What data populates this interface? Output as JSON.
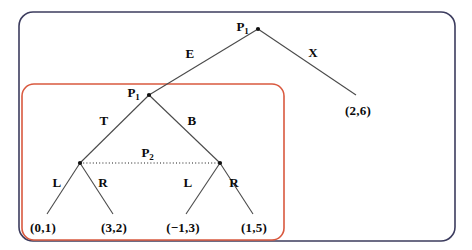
{
  "diagram": {
    "type": "game-tree",
    "background": "#ffffff",
    "boxes": [
      {
        "id": "outer-box",
        "name": "outer-scope-box",
        "color": "#3c3c5e",
        "x": 19,
        "y": 12,
        "width": 436,
        "height": 229,
        "radius": 14
      },
      {
        "id": "inner-box",
        "name": "inner-scope-box",
        "color": "#d9593f",
        "x": 22,
        "y": 84,
        "width": 262,
        "height": 156,
        "radius": 12
      }
    ],
    "nodes": [
      {
        "id": "root",
        "name": "root-node-p1",
        "label": "P",
        "sub": "1",
        "x": 258,
        "y": 29,
        "label_x": 243,
        "label_y": 26,
        "dot": true
      },
      {
        "id": "inner",
        "name": "inner-node-p1",
        "label": "P",
        "sub": "1",
        "x": 149,
        "y": 95,
        "label_x": 134,
        "label_y": 92,
        "dot": true
      },
      {
        "id": "left",
        "name": "left-internal-node",
        "label": "",
        "sub": "",
        "x": 80,
        "y": 163,
        "label_x": 80,
        "label_y": 163,
        "dot": true
      },
      {
        "id": "right",
        "name": "right-internal-node",
        "label": "",
        "sub": "",
        "x": 220,
        "y": 163,
        "label_x": 220,
        "label_y": 163,
        "dot": true
      }
    ],
    "infoset": {
      "name": "information-set-p2",
      "label": "P",
      "sub": "2",
      "from_x": 80,
      "from_y": 163,
      "to_x": 220,
      "to_y": 163,
      "label_x": 148,
      "label_y": 152,
      "style": "dotted"
    },
    "edges": [
      {
        "name": "edge-root-to-inner",
        "x1": 258,
        "y1": 29,
        "x2": 149,
        "y2": 95,
        "label": "E",
        "label_x": 190,
        "label_y": 53
      },
      {
        "name": "edge-root-to-leaf-x",
        "x1": 258,
        "y1": 29,
        "x2": 356,
        "y2": 95,
        "label": "X",
        "label_x": 313,
        "label_y": 52
      },
      {
        "name": "edge-inner-to-left",
        "x1": 149,
        "y1": 95,
        "x2": 80,
        "y2": 163,
        "label": "T",
        "label_x": 104,
        "label_y": 120
      },
      {
        "name": "edge-inner-to-right",
        "x1": 149,
        "y1": 95,
        "x2": 220,
        "y2": 163,
        "label": "B",
        "label_x": 192,
        "label_y": 120
      },
      {
        "name": "edge-left-to-leaf-l",
        "x1": 80,
        "y1": 163,
        "x2": 47,
        "y2": 214,
        "label": "L",
        "label_x": 57,
        "label_y": 182
      },
      {
        "name": "edge-left-to-leaf-r",
        "x1": 80,
        "y1": 163,
        "x2": 113,
        "y2": 214,
        "label": "R",
        "label_x": 103,
        "label_y": 182
      },
      {
        "name": "edge-right-to-leaf-l",
        "x1": 220,
        "y1": 163,
        "x2": 186,
        "y2": 214,
        "label": "L",
        "label_x": 188,
        "label_y": 182
      },
      {
        "name": "edge-right-to-leaf-r",
        "x1": 220,
        "y1": 163,
        "x2": 253,
        "y2": 214,
        "label": "R",
        "label_x": 234,
        "label_y": 182
      }
    ],
    "leaves": [
      {
        "name": "leaf-payoff-0-1",
        "label": "(0,1)",
        "x": 43,
        "y": 227
      },
      {
        "name": "leaf-payoff-3-2",
        "label": "(3,2)",
        "x": 114,
        "y": 227
      },
      {
        "name": "leaf-payoff-m1-3",
        "label": "(−1,3)",
        "x": 183,
        "y": 227
      },
      {
        "name": "leaf-payoff-1-5",
        "label": "(1,5)",
        "x": 254,
        "y": 227
      },
      {
        "name": "leaf-payoff-2-6",
        "label": "(2,6)",
        "x": 358,
        "y": 110
      }
    ],
    "edge_line_color": "#4a4a4a",
    "dot_color": "#101010"
  }
}
